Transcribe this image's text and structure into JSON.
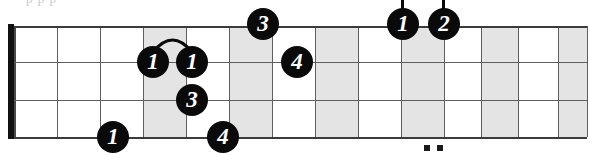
{
  "diagram": {
    "type": "guitar-fretboard-tab",
    "title_sliver": "p  p      p",
    "board": {
      "left": 14,
      "top": 26,
      "width": 573,
      "height": 111,
      "fret_count": 14,
      "string_count": 4,
      "nut": {
        "x": 8,
        "y": 24,
        "width": 6,
        "height": 115
      },
      "fret_x": [
        14,
        57,
        100,
        143,
        186,
        229,
        272,
        315,
        358,
        401,
        444,
        481,
        518,
        558,
        587
      ],
      "string_y": [
        26,
        62,
        100,
        137
      ],
      "shaded_frets": [
        3,
        5,
        7,
        9,
        11,
        13
      ],
      "grid_color": "#5e5e5e",
      "shade_color": "#e4e4e4",
      "note_color": "#0a0a0a",
      "note_text_color": "#ffffff"
    },
    "notes": [
      {
        "id": "note-1",
        "finger": "1",
        "x": 137,
        "y": 62,
        "stem": false
      },
      {
        "id": "note-2",
        "finger": "1",
        "x": 176,
        "y": 62,
        "stem": false
      },
      {
        "id": "note-3",
        "finger": "3",
        "x": 247,
        "y": 24,
        "stem": false
      },
      {
        "id": "note-4",
        "finger": "4",
        "x": 281,
        "y": 62,
        "stem": false
      },
      {
        "id": "note-5",
        "finger": "3",
        "x": 176,
        "y": 100,
        "stem": false
      },
      {
        "id": "note-6",
        "finger": "1",
        "x": 97,
        "y": 137,
        "stem": false
      },
      {
        "id": "note-7",
        "finger": "4",
        "x": 207,
        "y": 137,
        "stem": false
      },
      {
        "id": "note-8",
        "finger": "1",
        "x": 387,
        "y": 24,
        "stem": true
      },
      {
        "id": "note-9",
        "finger": "2",
        "x": 428,
        "y": 24,
        "stem": true
      }
    ],
    "slurs": [
      {
        "id": "slur-1",
        "from_x": 137,
        "to_x": 176,
        "y": 46
      }
    ],
    "inlays": [
      {
        "id": "inlay-12a",
        "x": 424,
        "y": 145
      },
      {
        "id": "inlay-12b",
        "x": 437,
        "y": 145
      }
    ]
  }
}
